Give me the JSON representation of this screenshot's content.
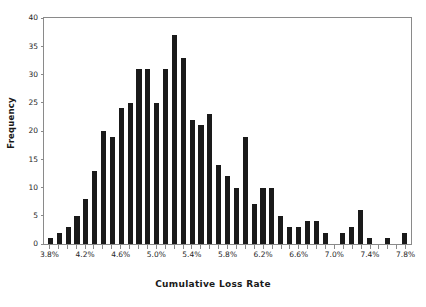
{
  "chart_data": {
    "type": "bar",
    "title": "",
    "subtitle": "",
    "xlabel": "Cumulative Loss Rate",
    "ylabel": "Frequency",
    "grid": false,
    "legend": null,
    "legend_position": "none",
    "bar_color": "#1a1a1a",
    "axis_color": "#8a8a8a",
    "background": "#ffffff",
    "ylim": [
      0,
      40
    ],
    "yticks": [
      0,
      5,
      10,
      15,
      20,
      25,
      30,
      35,
      40
    ],
    "ytick_labels": [
      "0",
      "5",
      "10",
      "15",
      "20",
      "25",
      "30",
      "35",
      "40"
    ],
    "xlim": [
      "3.8%",
      "7.8%"
    ],
    "bin_width": "0.1%",
    "xtick_labels": [
      "3.8%",
      "4.2%",
      "4.6%",
      "5.0%",
      "5.4%",
      "5.8%",
      "6.2%",
      "6.6%",
      "7.0%",
      "7.4%",
      "7.8%"
    ],
    "xtick_bin_index": [
      0,
      4,
      8,
      12,
      16,
      20,
      24,
      28,
      32,
      36,
      40
    ],
    "categories": [
      "3.8%",
      "3.9%",
      "4.0%",
      "4.1%",
      "4.2%",
      "4.3%",
      "4.4%",
      "4.5%",
      "4.6%",
      "4.7%",
      "4.8%",
      "4.9%",
      "5.0%",
      "5.1%",
      "5.2%",
      "5.3%",
      "5.4%",
      "5.5%",
      "5.6%",
      "5.7%",
      "5.8%",
      "5.9%",
      "6.0%",
      "6.1%",
      "6.2%",
      "6.3%",
      "6.4%",
      "6.5%",
      "6.6%",
      "6.7%",
      "6.8%",
      "6.9%",
      "7.0%",
      "7.1%",
      "7.2%",
      "7.3%",
      "7.4%",
      "7.5%",
      "7.6%",
      "7.7%",
      "7.8%"
    ],
    "values": [
      1,
      2,
      3,
      5,
      8,
      13,
      20,
      19,
      24,
      25,
      31,
      31,
      25,
      31,
      37,
      33,
      22,
      21,
      23,
      14,
      12,
      10,
      19,
      7,
      10,
      10,
      5,
      3,
      3,
      4,
      4,
      2,
      0,
      2,
      3,
      6,
      1,
      0,
      1,
      0,
      2
    ],
    "peak": {
      "category": "5.2%",
      "value": 37
    },
    "n_bins": 41
  }
}
